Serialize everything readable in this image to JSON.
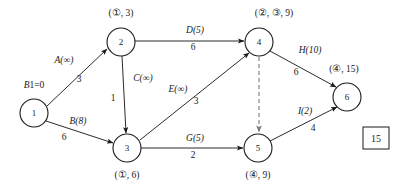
{
  "diagram": {
    "source_label": "B1=0",
    "result_box": "15",
    "ink_color": "#1a1a1a",
    "dashed_color": "#7a7a7a",
    "background": "#ffffff",
    "nodes": [
      {
        "id": "1",
        "number": "1",
        "tag": "",
        "cx": 34,
        "cy": 113,
        "r": 14,
        "tag_x": 34,
        "tag_y": 88
      },
      {
        "id": "2",
        "number": "2",
        "tag": "(①, 3)",
        "cx": 121,
        "cy": 42,
        "r": 14,
        "tag_x": 121,
        "tag_y": 16
      },
      {
        "id": "3",
        "number": "3",
        "tag": "(①, 6)",
        "cx": 127,
        "cy": 148,
        "r": 14,
        "tag_x": 127,
        "tag_y": 178
      },
      {
        "id": "4",
        "number": "4",
        "tag": "(②, ③, 9)",
        "cx": 259,
        "cy": 42,
        "r": 14,
        "tag_x": 274,
        "tag_y": 16
      },
      {
        "id": "5",
        "number": "5",
        "tag": "(④, 9)",
        "cx": 258,
        "cy": 148,
        "r": 14,
        "tag_x": 258,
        "tag_y": 178
      },
      {
        "id": "6",
        "number": "6",
        "tag": "(④, 15)",
        "cx": 347,
        "cy": 97,
        "r": 14,
        "tag_x": 344,
        "tag_y": 72
      }
    ],
    "edges": [
      {
        "id": "A",
        "from": "1",
        "to": "2",
        "name": "A(∞)",
        "weight": "3",
        "x1": 47,
        "y1": 106,
        "x2": 107,
        "y2": 49,
        "name_x": 64,
        "name_y": 63,
        "weight_x": 79,
        "weight_y": 82,
        "style": "solid",
        "arrow": true
      },
      {
        "id": "B",
        "from": "1",
        "to": "3",
        "name": "B(8)",
        "weight": "6",
        "x1": 46,
        "y1": 121,
        "x2": 113,
        "y2": 143,
        "name_x": 78,
        "name_y": 124,
        "weight_x": 64,
        "weight_y": 140,
        "style": "solid",
        "arrow": true
      },
      {
        "id": "C",
        "from": "2",
        "to": "3",
        "name": "C(∞)",
        "weight": "1",
        "x1": 122,
        "y1": 56,
        "x2": 126,
        "y2": 133,
        "name_x": 143,
        "name_y": 81,
        "weight_x": 113,
        "weight_y": 101,
        "style": "solid",
        "arrow": true
      },
      {
        "id": "D",
        "from": "2",
        "to": "4",
        "name": "D(5)",
        "weight": "6",
        "x1": 135,
        "y1": 41,
        "x2": 244,
        "y2": 41,
        "name_x": 195,
        "name_y": 33,
        "weight_x": 193,
        "weight_y": 50,
        "style": "solid",
        "arrow": true
      },
      {
        "id": "E",
        "from": "3",
        "to": "4",
        "name": "E(∞)",
        "weight": "3",
        "x1": 140,
        "y1": 140,
        "x2": 249,
        "y2": 53,
        "name_x": 178,
        "name_y": 92,
        "weight_x": 196,
        "weight_y": 104,
        "style": "solid",
        "arrow": true
      },
      {
        "id": "G",
        "from": "3",
        "to": "5",
        "name": "G(5)",
        "weight": "2",
        "x1": 141,
        "y1": 148,
        "x2": 243,
        "y2": 148,
        "name_x": 195,
        "name_y": 141,
        "weight_x": 193,
        "weight_y": 158,
        "style": "solid",
        "arrow": true
      },
      {
        "id": "H",
        "from": "4",
        "to": "6",
        "name": "H(10)",
        "weight": "6",
        "x1": 270,
        "y1": 51,
        "x2": 336,
        "y2": 87,
        "name_x": 310,
        "name_y": 53,
        "weight_x": 296,
        "weight_y": 75,
        "style": "solid",
        "arrow": true
      },
      {
        "id": "I",
        "from": "5",
        "to": "6",
        "name": "I(2)",
        "weight": "4",
        "x1": 270,
        "y1": 141,
        "x2": 337,
        "y2": 107,
        "name_x": 305,
        "name_y": 114,
        "weight_x": 313,
        "weight_y": 131,
        "style": "solid",
        "arrow": true
      },
      {
        "id": "F",
        "from": "4",
        "to": "5",
        "name": "",
        "weight": "",
        "x1": 259,
        "y1": 57,
        "x2": 259,
        "y2": 132,
        "name_x": 0,
        "name_y": 0,
        "weight_x": 0,
        "weight_y": 0,
        "style": "dashed",
        "arrow": true
      }
    ],
    "result_box_geom": {
      "x": 363,
      "y": 127,
      "w": 26,
      "h": 22
    },
    "source_label_pos": {
      "x": 34,
      "y": 88
    }
  },
  "icons": {
    "arrowhead": "arrow-head-icon"
  }
}
